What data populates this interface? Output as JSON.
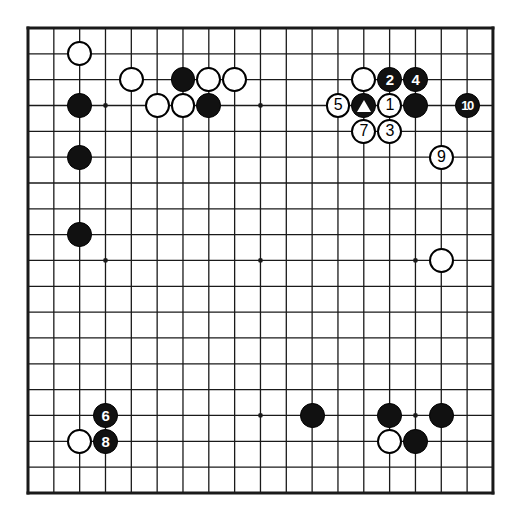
{
  "diagram": {
    "type": "go-board-diagram",
    "board_size": 19,
    "geometry": {
      "origin_x": 28,
      "origin_y": 28,
      "spacing": 25.83,
      "stone_radius": 12.4,
      "border_width": 3,
      "line_width": 1.3,
      "star_radius": 2.4
    },
    "colors": {
      "background": "#ffffff",
      "line": "#1a1a1a",
      "black_stone": "#111111",
      "white_stone": "#ffffff",
      "stone_outline": "#000000",
      "black_label": "#ffffff",
      "white_label": "#000000"
    },
    "star_points": [
      {
        "col": 3,
        "row": 3
      },
      {
        "col": 9,
        "row": 3
      },
      {
        "col": 15,
        "row": 3
      },
      {
        "col": 3,
        "row": 9
      },
      {
        "col": 9,
        "row": 9
      },
      {
        "col": 15,
        "row": 9
      },
      {
        "col": 3,
        "row": 15
      },
      {
        "col": 9,
        "row": 15
      },
      {
        "col": 15,
        "row": 15
      }
    ],
    "stones": [
      {
        "id": "w-c2r1",
        "color": "white",
        "col": 2,
        "row": 1,
        "label": "",
        "marker": ""
      },
      {
        "id": "w-c4r2",
        "color": "white",
        "col": 4,
        "row": 2,
        "label": "",
        "marker": ""
      },
      {
        "id": "b-c6r2",
        "color": "black",
        "col": 6,
        "row": 2,
        "label": "",
        "marker": ""
      },
      {
        "id": "w-c7r2",
        "color": "white",
        "col": 7,
        "row": 2,
        "label": "",
        "marker": ""
      },
      {
        "id": "w-c8r2",
        "color": "white",
        "col": 8,
        "row": 2,
        "label": "",
        "marker": ""
      },
      {
        "id": "b-c2r3",
        "color": "black",
        "col": 2,
        "row": 3,
        "label": "",
        "marker": ""
      },
      {
        "id": "w-c5r3",
        "color": "white",
        "col": 5,
        "row": 3,
        "label": "",
        "marker": ""
      },
      {
        "id": "w-c6r3",
        "color": "white",
        "col": 6,
        "row": 3,
        "label": "",
        "marker": ""
      },
      {
        "id": "b-c7r3",
        "color": "black",
        "col": 7,
        "row": 3,
        "label": "",
        "marker": ""
      },
      {
        "id": "b-c2r5",
        "color": "black",
        "col": 2,
        "row": 5,
        "label": "",
        "marker": ""
      },
      {
        "id": "b-c2r8",
        "color": "black",
        "col": 2,
        "row": 8,
        "label": "",
        "marker": ""
      },
      {
        "id": "w-c13r2",
        "color": "white",
        "col": 13,
        "row": 2,
        "label": "",
        "marker": ""
      },
      {
        "id": "b-c14r2",
        "color": "black",
        "col": 14,
        "row": 2,
        "label": "2",
        "marker": ""
      },
      {
        "id": "b-c15r2",
        "color": "black",
        "col": 15,
        "row": 2,
        "label": "4",
        "marker": ""
      },
      {
        "id": "w-c12r3",
        "color": "white",
        "col": 12,
        "row": 3,
        "label": "5",
        "marker": ""
      },
      {
        "id": "b-c13r3",
        "color": "black",
        "col": 13,
        "row": 3,
        "label": "",
        "marker": "triangle"
      },
      {
        "id": "w-c14r3",
        "color": "white",
        "col": 14,
        "row": 3,
        "label": "1",
        "marker": ""
      },
      {
        "id": "b-c15r3",
        "color": "black",
        "col": 15,
        "row": 3,
        "label": "",
        "marker": ""
      },
      {
        "id": "b-c17r3",
        "color": "black",
        "col": 17,
        "row": 3,
        "label": "10",
        "marker": ""
      },
      {
        "id": "w-c13r4",
        "color": "white",
        "col": 13,
        "row": 4,
        "label": "7",
        "marker": ""
      },
      {
        "id": "w-c14r4",
        "color": "white",
        "col": 14,
        "row": 4,
        "label": "3",
        "marker": ""
      },
      {
        "id": "w-c16r5",
        "color": "white",
        "col": 16,
        "row": 5,
        "label": "9",
        "marker": ""
      },
      {
        "id": "w-c16r9",
        "color": "white",
        "col": 16,
        "row": 9,
        "label": "",
        "marker": ""
      },
      {
        "id": "b-c3r15",
        "color": "black",
        "col": 3,
        "row": 15,
        "label": "6",
        "marker": ""
      },
      {
        "id": "w-c2r16",
        "color": "white",
        "col": 2,
        "row": 16,
        "label": "",
        "marker": ""
      },
      {
        "id": "b-c3r16",
        "color": "black",
        "col": 3,
        "row": 16,
        "label": "8",
        "marker": ""
      },
      {
        "id": "b-c11r15",
        "color": "black",
        "col": 11,
        "row": 15,
        "label": "",
        "marker": ""
      },
      {
        "id": "b-c14r15",
        "color": "black",
        "col": 14,
        "row": 15,
        "label": "",
        "marker": ""
      },
      {
        "id": "b-c16r15",
        "color": "black",
        "col": 16,
        "row": 15,
        "label": "",
        "marker": ""
      },
      {
        "id": "w-c14r16",
        "color": "white",
        "col": 14,
        "row": 16,
        "label": "",
        "marker": ""
      },
      {
        "id": "b-c15r16",
        "color": "black",
        "col": 15,
        "row": 16,
        "label": "",
        "marker": ""
      }
    ],
    "move_sequence": [
      {
        "move": "1",
        "color": "white",
        "col": 14,
        "row": 3
      },
      {
        "move": "2",
        "color": "black",
        "col": 14,
        "row": 2
      },
      {
        "move": "3",
        "color": "white",
        "col": 14,
        "row": 4
      },
      {
        "move": "4",
        "color": "black",
        "col": 15,
        "row": 2
      },
      {
        "move": "5",
        "color": "white",
        "col": 12,
        "row": 3
      },
      {
        "move": "6",
        "color": "black",
        "col": 3,
        "row": 15
      },
      {
        "move": "7",
        "color": "white",
        "col": 13,
        "row": 4
      },
      {
        "move": "8",
        "color": "black",
        "col": 3,
        "row": 16
      },
      {
        "move": "9",
        "color": "white",
        "col": 16,
        "row": 5
      },
      {
        "move": "10",
        "color": "black",
        "col": 17,
        "row": 3
      }
    ],
    "markers": [
      {
        "type": "triangle",
        "on_stone": "b-c13r3",
        "color": "white"
      }
    ]
  }
}
